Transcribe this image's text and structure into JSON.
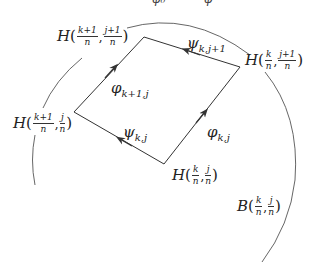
{
  "diagram": {
    "top_cut_text": {
      "left": "φ₀",
      "right": "φ"
    },
    "vertices": {
      "top_left": {
        "fn": "H",
        "arg1": {
          "num": "k+1",
          "den": "n"
        },
        "arg2": {
          "num": "j+1",
          "den": "n"
        }
      },
      "top_right": {
        "fn": "H",
        "arg1": {
          "num": "k",
          "den": "n"
        },
        "arg2": {
          "num": "j+1",
          "den": "n"
        }
      },
      "left": {
        "fn": "H",
        "arg1": {
          "num": "k+1",
          "den": "n"
        },
        "arg2": {
          "num": "j",
          "den": "n"
        }
      },
      "bottom": {
        "fn": "H",
        "arg1": {
          "num": "k",
          "den": "n"
        },
        "arg2": {
          "num": "j",
          "den": "n"
        }
      }
    },
    "edges": {
      "top": {
        "symbol": "ψ",
        "sub": "k,j+1",
        "direction": "right-to-left"
      },
      "upper_left": {
        "symbol": "φ",
        "sub": "k+1,j",
        "direction": "bottom-to-top"
      },
      "bottom": {
        "symbol": "ψ",
        "sub": "k,j",
        "direction": "right-to-left"
      },
      "right": {
        "symbol": "φ",
        "sub": "k,j",
        "direction": "bottom-to-top"
      }
    },
    "ball": {
      "fn": "B",
      "arg1": {
        "num": "k",
        "den": "n"
      },
      "arg2": {
        "num": "j",
        "den": "n"
      }
    },
    "colors": {
      "line": "#333333",
      "arc": "#555555",
      "text": "#222222"
    }
  }
}
